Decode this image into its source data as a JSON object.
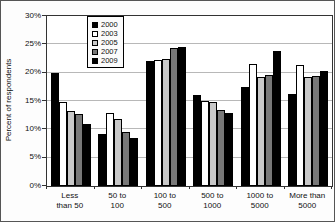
{
  "chart_data": {
    "type": "bar",
    "title": "",
    "xlabel": "",
    "ylabel": "Percent of respondents",
    "ylim": [
      0,
      30
    ],
    "ytick_step": 5,
    "ytick_labels": [
      "0%",
      "5%",
      "10%",
      "15%",
      "20%",
      "25%",
      "30%"
    ],
    "grid": true,
    "legend_position": "top-inside",
    "categories": [
      "Less than 50",
      "50 to 100",
      "100 to 500",
      "500 to 1000",
      "1000 to 5000",
      "More than 5000"
    ],
    "category_lines": [
      [
        "Less",
        "than 50"
      ],
      [
        "50 to",
        "100"
      ],
      [
        "100 to",
        "500"
      ],
      [
        "500 to",
        "1000"
      ],
      [
        "1000 to",
        "5000"
      ],
      [
        "More than",
        "5000"
      ]
    ],
    "series": [
      {
        "name": "2000",
        "color": "#000000",
        "values": [
          20.0,
          9.1,
          22.0,
          16.1,
          17.4,
          16.3
        ]
      },
      {
        "name": "2003",
        "color": "#ffffff",
        "values": [
          14.8,
          12.8,
          22.2,
          15.0,
          21.5,
          21.4
        ]
      },
      {
        "name": "2005",
        "color": "#c8c8c8",
        "values": [
          13.2,
          11.9,
          22.4,
          14.8,
          19.2,
          19.3
        ]
      },
      {
        "name": "2007",
        "color": "#787878",
        "values": [
          12.7,
          9.6,
          24.4,
          13.4,
          19.6,
          19.4
        ]
      },
      {
        "name": "2009",
        "color": "#000000",
        "values": [
          10.9,
          8.4,
          24.6,
          12.8,
          23.8,
          20.3
        ]
      }
    ]
  }
}
